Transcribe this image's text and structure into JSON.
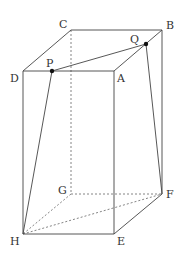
{
  "diagram": {
    "type": "rectangular-prism",
    "vertices": {
      "A": {
        "label": "A",
        "x": 114,
        "y": 71
      },
      "B": {
        "label": "B",
        "x": 162,
        "y": 30
      },
      "C": {
        "label": "C",
        "x": 71,
        "y": 30
      },
      "D": {
        "label": "D",
        "x": 23,
        "y": 71
      },
      "E": {
        "label": "E",
        "x": 114,
        "y": 234
      },
      "F": {
        "label": "F",
        "x": 162,
        "y": 194
      },
      "G": {
        "label": "G",
        "x": 71,
        "y": 194
      },
      "H": {
        "label": "H",
        "x": 23,
        "y": 234
      }
    },
    "points": {
      "P": {
        "label": "P",
        "x": 52,
        "y": 71
      },
      "Q": {
        "label": "Q",
        "x": 146,
        "y": 44
      }
    },
    "labels": {
      "A": "A",
      "B": "B",
      "C": "C",
      "D": "D",
      "E": "E",
      "F": "F",
      "G": "G",
      "H": "H",
      "P": "P",
      "Q": "Q"
    },
    "solid_edges": [
      [
        "D",
        "A"
      ],
      [
        "A",
        "B"
      ],
      [
        "B",
        "C"
      ],
      [
        "C",
        "D"
      ],
      [
        "D",
        "H"
      ],
      [
        "A",
        "E"
      ],
      [
        "B",
        "F"
      ],
      [
        "H",
        "E"
      ],
      [
        "E",
        "F"
      ],
      [
        "P",
        "Q"
      ],
      [
        "P",
        "H"
      ],
      [
        "Q",
        "F"
      ]
    ],
    "dashed_edges": [
      [
        "C",
        "G"
      ],
      [
        "G",
        "F"
      ],
      [
        "G",
        "H"
      ],
      [
        "H",
        "F"
      ]
    ],
    "colors": {
      "line": "#444444",
      "dashed": "#666666",
      "point": "#111111",
      "background": "#ffffff"
    }
  }
}
